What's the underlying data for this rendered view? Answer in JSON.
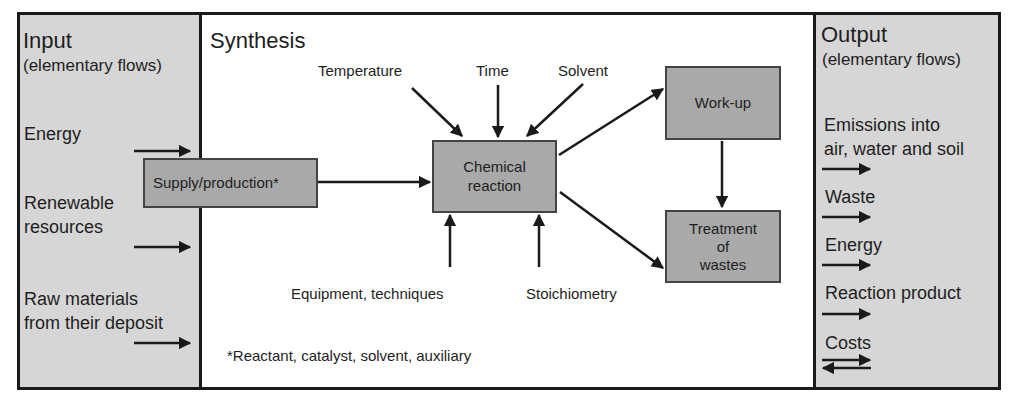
{
  "input": {
    "title": "Input",
    "subtitle": "(elementary flows)",
    "items": [
      {
        "line1": "Energy",
        "line2": ""
      },
      {
        "line1": "Renewable",
        "line2": "resources"
      },
      {
        "line1": "Raw materials",
        "line2": "from their deposit"
      }
    ]
  },
  "synthesis": {
    "title": "Synthesis",
    "supply_box": "Supply/production*",
    "reaction_box": {
      "line1": "Chemical",
      "line2": "reaction"
    },
    "workup_box": "Work-up",
    "treatment_box": {
      "line1": "Treatment",
      "line2": "of",
      "line3": "wastes"
    },
    "parameters_top": [
      "Temperature",
      "Time",
      "Solvent"
    ],
    "parameters_bottom": [
      "Equipment, techniques",
      "Stoichiometry"
    ],
    "footnote": "*Reactant, catalyst, solvent, auxiliary"
  },
  "output": {
    "title": "Output",
    "subtitle": "(elementary flows)",
    "items": [
      {
        "line1": "Emissions into",
        "line2": "air, water and soil"
      },
      {
        "line1": "Waste",
        "line2": ""
      },
      {
        "line1": "Energy",
        "line2": ""
      },
      {
        "line1": "Reaction product",
        "line2": ""
      },
      {
        "line1": "Costs",
        "line2": ""
      }
    ]
  },
  "colors": {
    "panel_fill": "#d6d6d6",
    "box_fill": "#a9a9a9",
    "line": "#1a1a1a"
  }
}
